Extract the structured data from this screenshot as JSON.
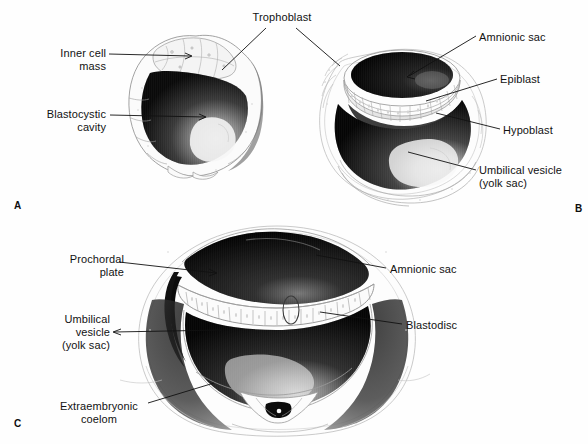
{
  "figure": {
    "background_color": "#fefefe",
    "ink_color": "#111111",
    "title_text": "",
    "panels": [
      {
        "letter": "A",
        "letter_pos": {
          "x": 14,
          "y": 200
        },
        "description": "Blastocyst with inner cell mass, trophoblast and blastocystic cavity",
        "labels": [
          {
            "name": "inner-cell-mass",
            "text": "Inner cell\nmass",
            "x": 44,
            "y": 47,
            "align": "right",
            "width": 62
          },
          {
            "name": "trophoblast",
            "text": "Trophoblast",
            "x": 237,
            "y": 11,
            "align": "center",
            "width": 70
          },
          {
            "name": "blastocystic-cavity",
            "text": "Blastocystic\ncavity",
            "x": 36,
            "y": 108,
            "align": "right",
            "width": 70
          }
        ]
      },
      {
        "letter": "B",
        "letter_pos": {
          "x": 575,
          "y": 203
        },
        "description": "Implanted blastocyst showing amnionic sac, epiblast, hypoblast and umbilical vesicle",
        "labels": [
          {
            "name": "amnionic-sac",
            "text": "Amnionic sac",
            "x": 479,
            "y": 31,
            "align": "left",
            "width": 80
          },
          {
            "name": "epiblast",
            "text": "Epiblast",
            "x": 500,
            "y": 73,
            "align": "left",
            "width": 52
          },
          {
            "name": "hypoblast",
            "text": "Hypoblast",
            "x": 503,
            "y": 124,
            "align": "left",
            "width": 62
          },
          {
            "name": "umbilical-vesicle-yolk-sac",
            "text": "Umbilical vesicle\n(yolk sac)",
            "x": 479,
            "y": 164,
            "align": "left",
            "width": 100
          }
        ]
      },
      {
        "letter": "C",
        "letter_pos": {
          "x": 14,
          "y": 418
        },
        "description": "Bilaminar embryonic disc with amnionic sac, blastodisc, prochordal plate, umbilical vesicle and extraembryonic coelom",
        "labels": [
          {
            "name": "prochordal-plate",
            "text": "Prochordal\nplate",
            "x": 58,
            "y": 253,
            "align": "right",
            "width": 66
          },
          {
            "name": "amnionic-sac",
            "text": "Amnionic sac",
            "x": 388,
            "y": 263,
            "align": "left",
            "width": 80
          },
          {
            "name": "umbilical-vesicle-yolk-sac",
            "text": "Umbilical\nvesicle\n(yolk sac)",
            "x": 46,
            "y": 313,
            "align": "right",
            "width": 64
          },
          {
            "name": "blastodisc",
            "text": "Blastodisc",
            "x": 405,
            "y": 319,
            "align": "left",
            "width": 62
          },
          {
            "name": "extraembryonic-coelom",
            "text": "Extraembryonic\ncoelom",
            "x": 56,
            "y": 400,
            "align": "center",
            "width": 90
          }
        ]
      }
    ]
  }
}
